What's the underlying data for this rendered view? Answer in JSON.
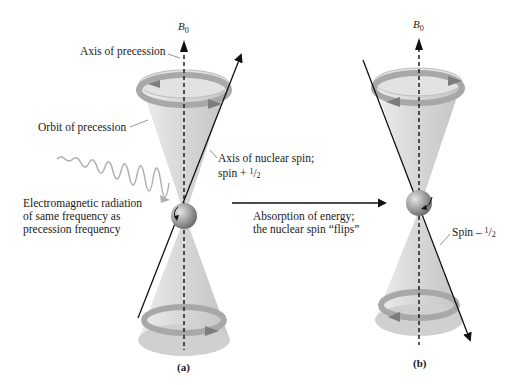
{
  "diagram": {
    "panel_a": {
      "label": "(a)",
      "field_label": "B",
      "field_subscript": "0",
      "labels": {
        "axis_of_precession": "Axis of precession",
        "orbit_of_precession": "Orbit of precession",
        "axis_of_nuclear_spin_line1": "Axis of nuclear spin;",
        "axis_of_nuclear_spin_line2_prefix": "spin + ",
        "em_radiation_line1": "Electromagnetic radiation",
        "em_radiation_line2": "of same frequency as",
        "em_radiation_line3": "precession frequency"
      },
      "spin_value_num": "1",
      "spin_value_den": "2"
    },
    "transition": {
      "line1": "Absorption of energy;",
      "line2": "the nuclear spin “flips”"
    },
    "panel_b": {
      "label": "(b)",
      "field_label": "B",
      "field_subscript": "0",
      "spin_label_prefix": "Spin – ",
      "spin_value_num": "1",
      "spin_value_den": "2"
    },
    "colors": {
      "cone_fill": "#d9d9d9",
      "cone_edge": "#bdbdbd",
      "band": "#a8a8a8",
      "band_dark": "#7d7d7d",
      "sphere": "#8a8a8a",
      "wave": "#b0b0b0",
      "ink": "#111111"
    }
  }
}
